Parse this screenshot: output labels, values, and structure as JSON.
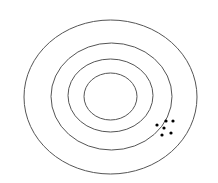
{
  "diagram": {
    "type": "target",
    "stroke_color": "#555555",
    "dot_color": "#000000",
    "rings": [
      {
        "cx": 110.5,
        "cy": 97,
        "rx": 86.5,
        "ry": 77
      },
      {
        "cx": 111.5,
        "cy": 96.5,
        "rx": 60.5,
        "ry": 53.5
      },
      {
        "cx": 110.5,
        "cy": 95.5,
        "rx": 42.5,
        "ry": 36.5
      },
      {
        "cx": 110.5,
        "cy": 96.5,
        "rx": 26.5,
        "ry": 23.5
      }
    ],
    "shots": [
      {
        "x": 157,
        "y": 125
      },
      {
        "x": 166,
        "y": 121
      },
      {
        "x": 173,
        "y": 121
      },
      {
        "x": 164,
        "y": 128
      },
      {
        "x": 162,
        "y": 135
      },
      {
        "x": 171,
        "y": 133
      }
    ]
  }
}
